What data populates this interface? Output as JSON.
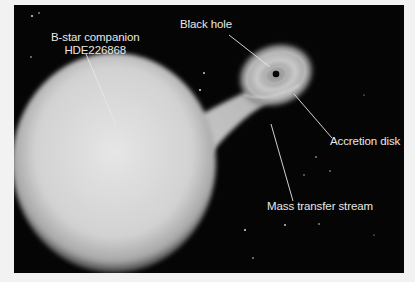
{
  "figure": {
    "background_color": "#050505",
    "page_color": "#f2f2f2",
    "label_color": "#e8e8e8",
    "labels": [
      {
        "id": "bstar",
        "line1": "B-star companion",
        "line2": "HDE226868"
      },
      {
        "id": "blackhole",
        "text": "Black hole"
      },
      {
        "id": "accretion",
        "text": "Accretion disk"
      },
      {
        "id": "stream",
        "text": "Mass transfer stream"
      }
    ]
  }
}
